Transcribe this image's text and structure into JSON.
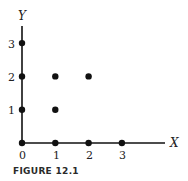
{
  "chart_data": {
    "type": "scatter",
    "title": "",
    "caption": "FIGURE 12.1",
    "xlabel": "X",
    "ylabel": "Y",
    "xlim": [
      0,
      3
    ],
    "ylim": [
      0,
      3
    ],
    "grid": false,
    "x_ticks": [
      "0",
      "1",
      "2",
      "3"
    ],
    "y_ticks": [
      "1",
      "2",
      "3"
    ],
    "points": [
      {
        "x": 0,
        "y": 0
      },
      {
        "x": 1,
        "y": 0
      },
      {
        "x": 2,
        "y": 0
      },
      {
        "x": 3,
        "y": 0
      },
      {
        "x": 0,
        "y": 1
      },
      {
        "x": 1,
        "y": 1
      },
      {
        "x": 0,
        "y": 2
      },
      {
        "x": 1,
        "y": 2
      },
      {
        "x": 2,
        "y": 2
      },
      {
        "x": 0,
        "y": 3
      }
    ]
  },
  "colors": {
    "ink": "#111111"
  }
}
